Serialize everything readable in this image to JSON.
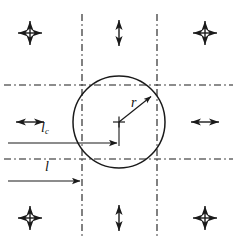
{
  "figure": {
    "background_color": "#ffffff",
    "stroke_color": "#1a1a1a",
    "labels": {
      "radius": "r",
      "characteristic_length_symbol": "l",
      "characteristic_length_subscript": "c",
      "length": "l"
    },
    "circle": {
      "center_x": 119,
      "center_y": 122,
      "radius": 46,
      "center_marker": "plus-mark"
    },
    "grid": {
      "line_style": "dash-dot",
      "vertical_lines_x": [
        82,
        157
      ],
      "horizontal_lines_y": [
        85,
        159
      ]
    },
    "dimension_arrows": [
      {
        "name": "l_c",
        "from_x": 8,
        "to_x": 119,
        "y": 143,
        "head": "single-right"
      },
      {
        "name": "l",
        "from_x": 8,
        "to_x": 82,
        "y": 181,
        "head": "single-right"
      },
      {
        "name": "r",
        "from_x": 119,
        "from_y": 122,
        "to_x": 152,
        "to_y": 96,
        "head": "single-end"
      }
    ],
    "motion_markers": [
      {
        "name": "top-left-cross-arrow",
        "type": "cross",
        "x": 30,
        "y": 33
      },
      {
        "name": "top-center-vertical-arrow",
        "type": "vertical",
        "x": 119,
        "y": 33
      },
      {
        "name": "top-right-cross-arrow",
        "type": "cross",
        "x": 205,
        "y": 33
      },
      {
        "name": "middle-left-horizontal-arrow",
        "type": "horizontal",
        "x": 30,
        "y": 122
      },
      {
        "name": "middle-right-horizontal-arrow",
        "type": "horizontal",
        "x": 205,
        "y": 122
      },
      {
        "name": "bottom-left-cross-arrow",
        "type": "cross",
        "x": 30,
        "y": 218
      },
      {
        "name": "bottom-center-vertical-arrow",
        "type": "vertical",
        "x": 119,
        "y": 218
      },
      {
        "name": "bottom-right-cross-arrow",
        "type": "cross",
        "x": 205,
        "y": 218
      }
    ]
  }
}
